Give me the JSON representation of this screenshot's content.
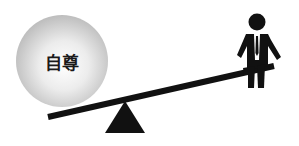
{
  "diagram": {
    "type": "seesaw-metaphor",
    "ball": {
      "label": "自尊",
      "fill_center": "#ffffff",
      "fill_edge": "#bdbdbd"
    },
    "figure": {
      "name": "businessman-sitting",
      "color": "#111111"
    },
    "plank": {
      "color": "#111111"
    },
    "fulcrum": {
      "color": "#111111"
    }
  }
}
